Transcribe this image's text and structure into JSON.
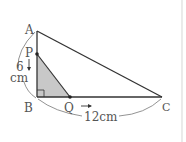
{
  "figure": {
    "type": "right-triangle geometry diagram",
    "colors": {
      "line": "#333333",
      "shade": "#c8c8c8",
      "label": "#555555",
      "arc": "#777777",
      "border": "#dddddd"
    },
    "points": {
      "A": {
        "label": "A",
        "x": 37,
        "y": 31
      },
      "P": {
        "label": "P",
        "x": 37,
        "y": 54
      },
      "B": {
        "label": "B",
        "x": 37,
        "y": 97
      },
      "Q": {
        "label": "Q",
        "x": 70,
        "y": 97
      },
      "C": {
        "label": "C",
        "x": 162,
        "y": 97
      }
    },
    "dimensions": {
      "AB": {
        "value": "6",
        "unit": "cm"
      },
      "BC": {
        "text": "12cm"
      }
    },
    "shaded_region": "triangle PBQ",
    "right_angle_at": "B",
    "motion": {
      "P": "moves downward from A toward B",
      "Q": "moves rightward from B toward C"
    }
  }
}
